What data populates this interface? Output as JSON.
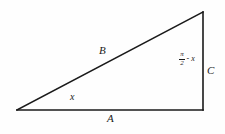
{
  "figure": {
    "type": "right-triangle-diagram",
    "background_color": "#fefefe",
    "stroke_color": "#1a1a1a",
    "geometry": {
      "left_vertex": [
        17,
        110
      ],
      "bottom_right_vertex": [
        203,
        110
      ],
      "top_right_vertex": [
        203,
        12
      ],
      "base_length_px": 186,
      "height_px": 98
    },
    "labels": {
      "side_a": "A",
      "side_b": "B",
      "side_c": "C",
      "angle_x": "x",
      "angle_complement_numerator": "π",
      "angle_complement_denominator": "2",
      "angle_complement_operator": "- x"
    }
  }
}
